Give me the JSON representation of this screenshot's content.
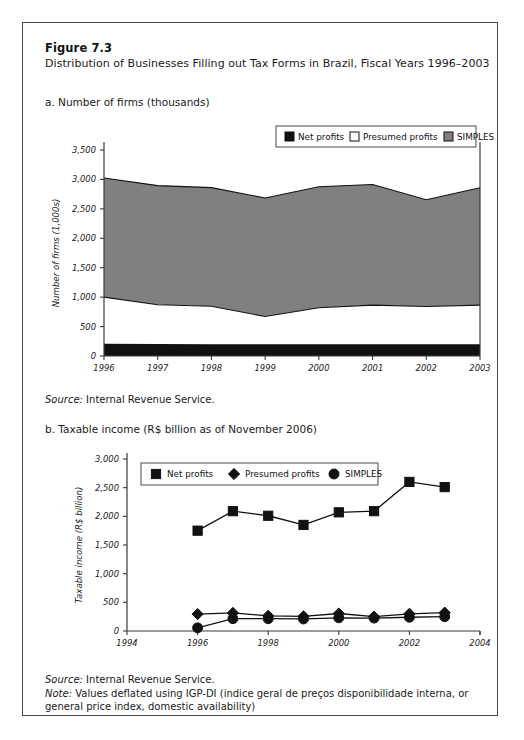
{
  "figure": {
    "number": "Figure 7.3",
    "title": "Distribution of Businesses Filling out Tax Forms in Brazil, Fiscal Years 1996–2003"
  },
  "panel_a": {
    "label": "a. Number of firms (thousands)",
    "source_prefix": "Source:",
    "source_text": " Internal Revenue Service."
  },
  "panel_b": {
    "label": "b. Taxable income (R$ billion as of November 2006)",
    "source_prefix": "Source:",
    "source_text": " Internal Revenue Service.",
    "note_prefix": "Note:",
    "note_text": " Values deflated using IGP-DI (indice geral de preços disponibilidade interna, or general price index, domestic availability)"
  },
  "colors": {
    "net_profits": "#111111",
    "presumed_profits": "#ffffff",
    "simples": "#808080",
    "axis": "#3a3a3a",
    "border": "#4a4a4a"
  },
  "chart_data": [
    {
      "type": "area",
      "id": "panel-a",
      "title": "a. Number of firms (thousands)",
      "stacked": true,
      "xlabel": "",
      "ylabel": "Number of firms (1,000s)",
      "ylim": [
        0,
        3500
      ],
      "yticks": [
        "0",
        "500",
        "1,000",
        "1,500",
        "2,000",
        "2,500",
        "3,000",
        "3,500"
      ],
      "ytick_values": [
        0,
        500,
        1000,
        1500,
        2000,
        2500,
        3000,
        3500
      ],
      "categories": [
        "1996",
        "1997",
        "1998",
        "1999",
        "2000",
        "2001",
        "2002",
        "2003"
      ],
      "x": [
        1996,
        1997,
        1998,
        1999,
        2000,
        2001,
        2002,
        2003
      ],
      "xlim": [
        1996,
        2003
      ],
      "grid": false,
      "legend_position": "top-right",
      "series": [
        {
          "name": "Net profits",
          "color": "#111111",
          "values": [
            210,
            205,
            200,
            200,
            200,
            200,
            200,
            200
          ]
        },
        {
          "name": "Presumed profits",
          "color": "#ffffff",
          "values": [
            790,
            665,
            645,
            470,
            620,
            665,
            640,
            665
          ]
        },
        {
          "name": "SIMPLES",
          "color": "#808080",
          "values": [
            2025,
            2025,
            2015,
            2015,
            2055,
            2050,
            1815,
            1995
          ]
        }
      ],
      "cumulative_tops": {
        "net_profits": [
          210,
          205,
          200,
          200,
          200,
          200,
          200,
          200
        ],
        "presumed_profits": [
          1000,
          870,
          845,
          670,
          820,
          865,
          840,
          865
        ],
        "total": [
          3025,
          2895,
          2860,
          2685,
          2875,
          2915,
          2655,
          2860
        ]
      }
    },
    {
      "type": "line",
      "id": "panel-b",
      "title": "b. Taxable income (R$ billion as of November 2006)",
      "xlabel": "",
      "ylabel": "Taxable income (R$ billion)",
      "ylim": [
        0,
        3000
      ],
      "yticks": [
        "0",
        "500",
        "1,000",
        "1,500",
        "2,000",
        "2,500",
        "3,000"
      ],
      "ytick_values": [
        0,
        500,
        1000,
        1500,
        2000,
        2500,
        3000
      ],
      "xlim": [
        1994,
        2004
      ],
      "xticks": [
        "1994",
        "1996",
        "1998",
        "2000",
        "2002",
        "2004"
      ],
      "xtick_values": [
        1994,
        1996,
        1998,
        2000,
        2002,
        2004
      ],
      "x": [
        1996,
        1997,
        1998,
        1999,
        2000,
        2001,
        2002,
        2003
      ],
      "grid": false,
      "legend_position": "top-left",
      "series": [
        {
          "name": "Net profits",
          "marker": "square",
          "color": "#111111",
          "values": [
            1750,
            2090,
            2010,
            1850,
            2070,
            2090,
            2600,
            2510
          ]
        },
        {
          "name": "Presumed profits",
          "marker": "diamond",
          "color": "#111111",
          "values": [
            295,
            315,
            265,
            255,
            305,
            250,
            300,
            320
          ]
        },
        {
          "name": "SIMPLES",
          "marker": "circle",
          "color": "#111111",
          "values": [
            55,
            215,
            215,
            210,
            230,
            225,
            240,
            250
          ]
        }
      ]
    }
  ]
}
